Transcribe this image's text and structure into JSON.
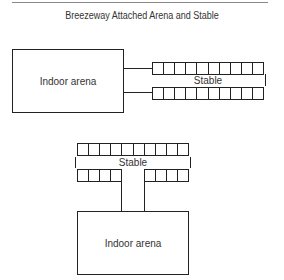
{
  "title": "Breezeway Attached Arena and Stable",
  "diagrams": [
    {
      "name": "side-attached",
      "arena_label": "Indoor arena",
      "stable_label": "Stable",
      "top_row_stalls": 10,
      "bottom_row_stalls": 10,
      "breezeways": 2
    },
    {
      "name": "end-attached",
      "arena_label": "Indoor arena",
      "stable_label": "Stable",
      "top_row_stalls": 10,
      "bottom_row_stalls_left": 4,
      "bottom_row_stalls_right": 4,
      "breezeways": 1
    }
  ],
  "colors": {
    "line": "#222222",
    "text": "#333333",
    "rule": "#8a8a8a"
  }
}
